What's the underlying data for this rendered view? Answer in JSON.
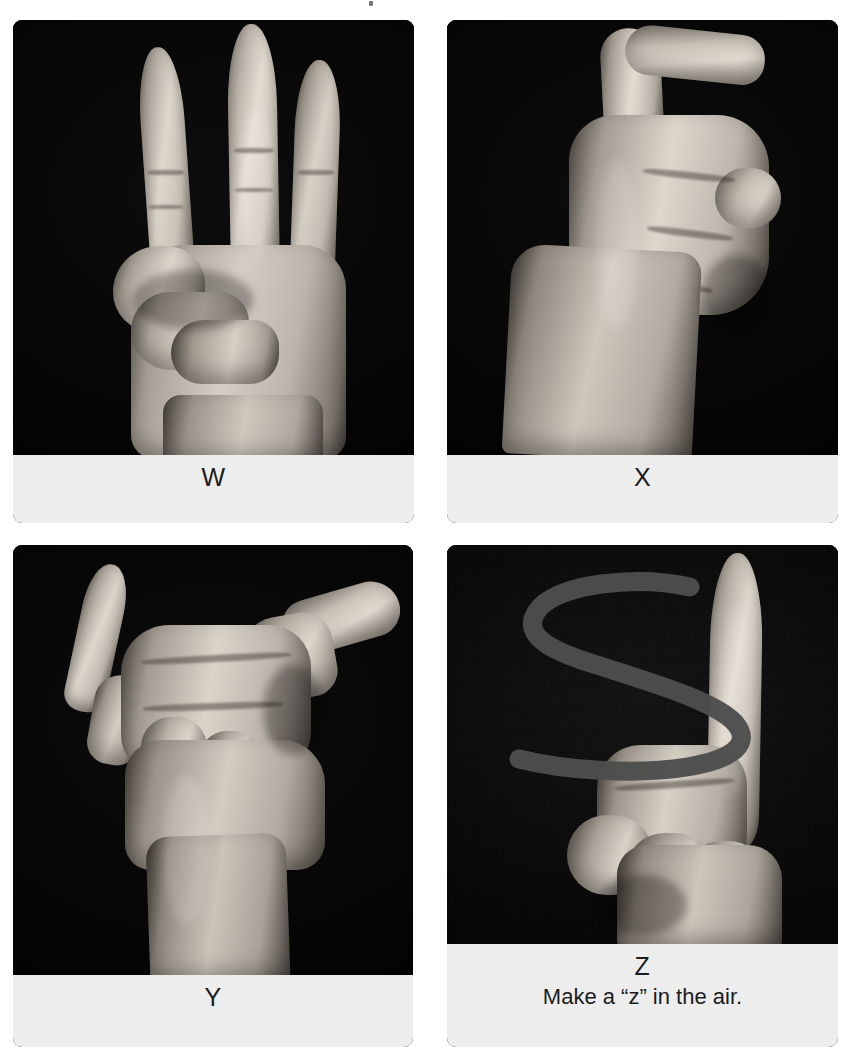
{
  "page": {
    "background_color": "#ffffff",
    "caption_band_color": "#ededed",
    "photo_background_color": "#050505",
    "text_color": "#1b1b1b",
    "columns": 2,
    "rows": 2
  },
  "cards": [
    {
      "id": "card-w",
      "letter": "W",
      "note": "",
      "image_alt": "Hand showing ASL letter W: index, middle and ring fingers extended upward, thumb holding down the little finger.",
      "position": "top-left"
    },
    {
      "id": "card-x",
      "letter": "X",
      "note": "",
      "image_alt": "Hand showing ASL letter X: index finger bent into a hook, other fingers closed into a fist.",
      "position": "top-right"
    },
    {
      "id": "card-y",
      "letter": "Y",
      "note": "",
      "image_alt": "Hand showing ASL letter Y: thumb and little finger extended, middle fingers folded down.",
      "position": "bottom-left"
    },
    {
      "id": "card-z",
      "letter": "Z",
      "note": "Make a “z” in the air.",
      "image_alt": "Hand showing ASL letter Z: index finger extended upward with a drawn z-shaped motion arrow across the image.",
      "position": "bottom-right",
      "overlay": {
        "name": "z-motion-stroke",
        "color": "#4a4a4a",
        "stroke_width": 18
      }
    }
  ]
}
